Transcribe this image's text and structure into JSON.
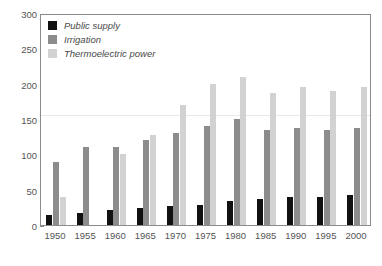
{
  "chart_data": {
    "type": "bar",
    "title": "",
    "subtitle": "",
    "xlabel": "",
    "ylabel": "",
    "ylim": [
      0,
      300
    ],
    "ytick_labels": [
      "0",
      "50",
      "100",
      "150",
      "200",
      "250",
      "300"
    ],
    "ytick_values": [
      0,
      50,
      100,
      150,
      200,
      250,
      300
    ],
    "grid": false,
    "legend_position": "top-left",
    "categories": [
      "1950",
      "1955",
      "1960",
      "1965",
      "1970",
      "1975",
      "1980",
      "1985",
      "1990",
      "1995",
      "2000"
    ],
    "series": [
      {
        "name": "Public supply",
        "color": "#111111",
        "values": [
          14,
          17,
          21,
          24,
          27,
          29,
          34,
          37,
          39,
          40,
          43
        ]
      },
      {
        "name": "Irrigation",
        "color": "#8c8c8c",
        "values": [
          89,
          110,
          110,
          120,
          130,
          140,
          150,
          135,
          137,
          134,
          137
        ]
      },
      {
        "name": "Thermoelectric power",
        "color": "#d2d2d2",
        "values": [
          40,
          0,
          100,
          128,
          170,
          200,
          210,
          187,
          195,
          190,
          195
        ]
      }
    ]
  },
  "axis": {
    "frame_color": "#8a8a8a",
    "tick_color": "#555555"
  }
}
